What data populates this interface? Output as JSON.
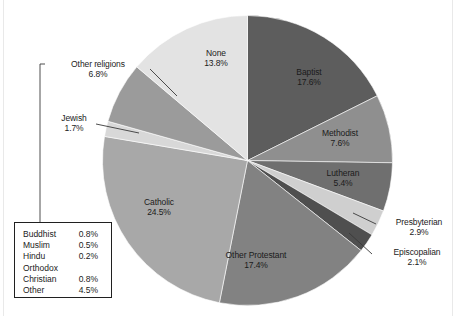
{
  "figure": {
    "background_color": "#ffffff",
    "text_color": "#1b1b1b"
  },
  "chart_data": {
    "type": "pie",
    "title": "",
    "subtitle": "",
    "xlabel": "",
    "ylabel": "",
    "grid": false,
    "legend_position": "bottom-left-box",
    "units": "percent",
    "start_angle_deg": 0,
    "direction": "clockwise",
    "categories": [
      "Baptist",
      "Methodist",
      "Lutheran",
      "Presbyterian",
      "Episcopalian",
      "Other Protestant",
      "Catholic",
      "Jewish",
      "Other religions",
      "None"
    ],
    "values": [
      17.6,
      7.6,
      5.4,
      2.9,
      2.1,
      17.4,
      24.5,
      1.7,
      6.8,
      13.8
    ],
    "colors": [
      "#5d5d5d",
      "#8f8f8f",
      "#6f6f6f",
      "#cfcfcf",
      "#4f4f4f",
      "#828282",
      "#a8a8a8",
      "#d8d8d8",
      "#9b9b9b",
      "#e3e3e3"
    ],
    "slices": [
      {
        "label": "Baptist",
        "percent": "17.6%",
        "value": 17.6,
        "color": "#5d5d5d"
      },
      {
        "label": "Methodist",
        "percent": "7.6%",
        "value": 7.6,
        "color": "#8f8f8f"
      },
      {
        "label": "Lutheran",
        "percent": "5.4%",
        "value": 5.4,
        "color": "#6f6f6f"
      },
      {
        "label": "Presbyterian",
        "percent": "2.9%",
        "value": 2.9,
        "color": "#cfcfcf"
      },
      {
        "label": "Episcopalian",
        "percent": "2.1%",
        "value": 2.1,
        "color": "#4f4f4f"
      },
      {
        "label": "Other Protestant",
        "percent": "17.4%",
        "value": 17.4,
        "color": "#828282"
      },
      {
        "label": "Catholic",
        "percent": "24.5%",
        "value": 24.5,
        "color": "#a8a8a8"
      },
      {
        "label": "Jewish",
        "percent": "1.7%",
        "value": 1.7,
        "color": "#d8d8d8"
      },
      {
        "label": "Other religions",
        "percent": "6.8%",
        "value": 6.8,
        "color": "#9b9b9b"
      },
      {
        "label": "None",
        "percent": "13.8%",
        "value": 13.8,
        "color": "#e3e3e3"
      }
    ],
    "breakdown_note": "Other religions 6.8% is itemized in the adjacent box",
    "breakdown": {
      "rows": [
        {
          "label": "Buddhist",
          "percent": "0.8%"
        },
        {
          "label": "Muslim",
          "percent": "0.5%"
        },
        {
          "label": "Hindu",
          "percent": "0.2%"
        },
        {
          "label": "Orthodox",
          "percent": ""
        },
        {
          "label": "Christian",
          "percent": "0.8%"
        },
        {
          "label": "Other",
          "percent": "4.5%"
        }
      ]
    }
  }
}
